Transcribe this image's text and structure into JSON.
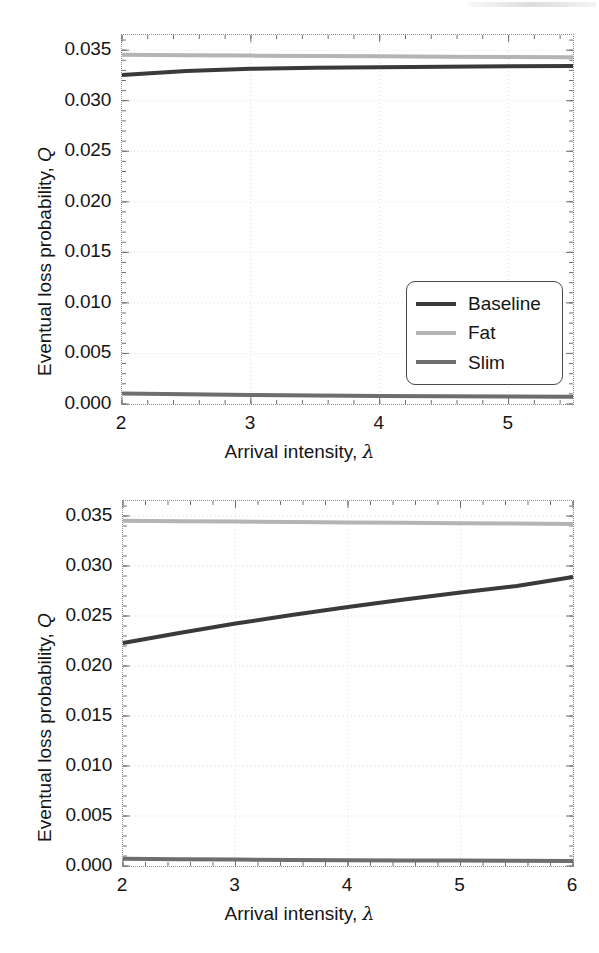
{
  "figure": {
    "background_color": "#ffffff",
    "panel_count": 2
  },
  "series_colors": {
    "Baseline": "#3a3a3a",
    "Fat": "#b4b4b4",
    "Slim": "#6e6e6e"
  },
  "labels": {
    "xaxis_title_prefix": "Arrival intensity, ",
    "xaxis_title_symbol": "λ",
    "yaxis_title_prefix": "Eventual loss probability, ",
    "yaxis_title_symbol": "Q",
    "legend_baseline": "Baseline",
    "legend_fat": "Fat",
    "legend_slim": "Slim"
  },
  "chart_data": [
    {
      "id": "top",
      "type": "line",
      "title": "",
      "xlabel": "Arrival intensity, λ",
      "ylabel": "Eventual loss probability, Q",
      "xlim": [
        2.0,
        5.5
      ],
      "ylim": [
        0.0,
        0.0365
      ],
      "grid": true,
      "grid_style": "dotted",
      "legend_position": "lower-right",
      "xticks": [
        2,
        3,
        4,
        5
      ],
      "xtick_labels": [
        "2",
        "3",
        "4",
        "5"
      ],
      "yticks": [
        0.0,
        0.005,
        0.01,
        0.015,
        0.02,
        0.025,
        0.03,
        0.035
      ],
      "ytick_labels": [
        "0.000",
        "0.005",
        "0.010",
        "0.015",
        "0.020",
        "0.025",
        "0.030",
        "0.035"
      ],
      "x": [
        2.0,
        2.5,
        3.0,
        3.5,
        4.0,
        4.5,
        5.0,
        5.5
      ],
      "series": [
        {
          "name": "Baseline",
          "color": "#3a3a3a",
          "values": [
            0.03255,
            0.03295,
            0.03315,
            0.03325,
            0.03332,
            0.03337,
            0.03341,
            0.03344
          ]
        },
        {
          "name": "Fat",
          "color": "#b4b4b4",
          "values": [
            0.03455,
            0.0345,
            0.03446,
            0.03442,
            0.03439,
            0.03436,
            0.03433,
            0.0343
          ]
        },
        {
          "name": "Slim",
          "color": "#6e6e6e",
          "values": [
            0.00105,
            0.00096,
            0.00089,
            0.00084,
            0.0008,
            0.00077,
            0.00074,
            0.00072
          ]
        }
      ]
    },
    {
      "id": "bottom",
      "type": "line",
      "title": "",
      "xlabel": "Arrival intensity, λ",
      "ylabel": "Eventual loss probability, Q",
      "xlim": [
        2.0,
        6.0
      ],
      "ylim": [
        0.0,
        0.0365
      ],
      "grid": true,
      "grid_style": "dotted",
      "legend_position": "lower-right",
      "xticks": [
        2,
        3,
        4,
        5,
        6
      ],
      "xtick_labels": [
        "2",
        "3",
        "4",
        "5",
        "6"
      ],
      "yticks": [
        0.0,
        0.005,
        0.01,
        0.015,
        0.02,
        0.025,
        0.03,
        0.035
      ],
      "ytick_labels": [
        "0.000",
        "0.005",
        "0.010",
        "0.015",
        "0.020",
        "0.025",
        "0.030",
        "0.035"
      ],
      "x": [
        2.0,
        2.5,
        3.0,
        3.5,
        4.0,
        4.5,
        5.0,
        5.5,
        6.0
      ],
      "series": [
        {
          "name": "Baseline",
          "color": "#3a3a3a",
          "values": [
            0.0223,
            0.0233,
            0.02425,
            0.0251,
            0.0259,
            0.02665,
            0.02735,
            0.028,
            0.0289
          ]
        },
        {
          "name": "Fat",
          "color": "#b4b4b4",
          "values": [
            0.03452,
            0.03448,
            0.03444,
            0.0344,
            0.03436,
            0.03432,
            0.03428,
            0.03424,
            0.0342
          ]
        },
        {
          "name": "Slim",
          "color": "#6e6e6e",
          "values": [
            0.00072,
            0.00068,
            0.00064,
            0.00061,
            0.00058,
            0.00056,
            0.00054,
            0.00052,
            0.0005
          ]
        }
      ]
    }
  ]
}
